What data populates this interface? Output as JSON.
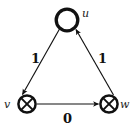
{
  "diagram": {
    "type": "directed-weighted-graph",
    "title": "",
    "background_color": "#ffffff",
    "stroke_color": "#111111",
    "nodes": [
      {
        "id": "u",
        "label": "u",
        "shape": "open-circle",
        "cx": 67,
        "cy": 20,
        "r": 11,
        "stroke_width": 3.2,
        "label_position": "right"
      },
      {
        "id": "v",
        "label": "v",
        "shape": "circled-cross",
        "cx": 27,
        "cy": 104,
        "r": 9,
        "stroke_width": 2.6,
        "label_position": "left"
      },
      {
        "id": "w",
        "label": "w",
        "shape": "circled-cross",
        "cx": 109,
        "cy": 104,
        "r": 9,
        "stroke_width": 2.6,
        "label_position": "right"
      }
    ],
    "edges": [
      {
        "id": "u-v",
        "from": "u",
        "to": "v",
        "weight": "1",
        "directed": true,
        "label_x": 31,
        "label_y": 52
      },
      {
        "id": "w-u",
        "from": "w",
        "to": "u",
        "weight": "1",
        "directed": true,
        "label_x": 98,
        "label_y": 52
      },
      {
        "id": "v-w",
        "from": "v",
        "to": "w",
        "weight": "0",
        "directed": true,
        "label_x": 63,
        "label_y": 112
      }
    ]
  }
}
